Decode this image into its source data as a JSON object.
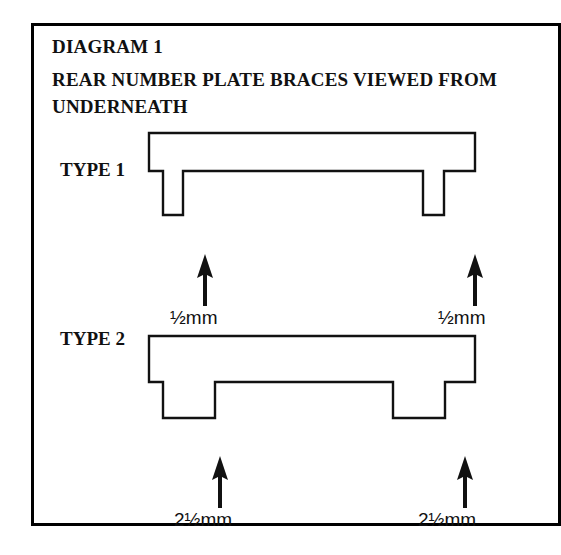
{
  "diagram": {
    "title": "DIAGRAM 1",
    "subtitle_line_1": "REAR NUMBER PLATE BRACES VIEWED FROM",
    "subtitle_line_2": "UNDERNEATH",
    "border_color": "#000000",
    "line_color": "#111111",
    "background_color": "#ffffff"
  },
  "types": [
    {
      "label": "TYPE 1",
      "leg_style": "narrow",
      "measure_left": "½mm",
      "measure_right": "½mm"
    },
    {
      "label": "TYPE 2",
      "leg_style": "wide",
      "measure_left": "2½mm",
      "measure_right": "2½mm"
    }
  ],
  "icons": {
    "arrow_up": "arrow-up-icon"
  }
}
